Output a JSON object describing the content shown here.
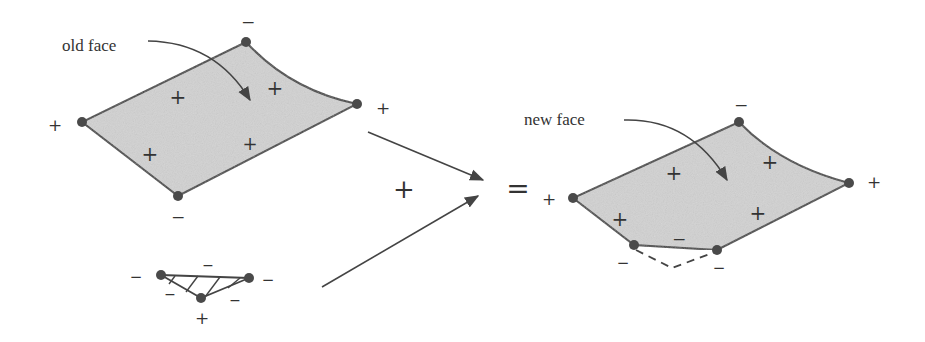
{
  "diagram": {
    "colors": {
      "face_fill": "#d2d2d2",
      "stroke": "#444444",
      "vertex": "#4a4a4a",
      "text": "#333333"
    },
    "old_face": {
      "caption": "old face",
      "vertex_signs": {
        "left": "+",
        "top": "−",
        "right": "+",
        "bottom": "−"
      },
      "interior_signs": [
        "+",
        "+",
        "+",
        "+"
      ]
    },
    "triangle": {
      "vertex_signs": {
        "left": "−",
        "right": "−",
        "bottom": "+"
      },
      "edge_signs": [
        "−",
        "−",
        "−"
      ]
    },
    "operators": {
      "plus": "+",
      "equals": "="
    },
    "new_face": {
      "caption": "new face",
      "vertex_signs": {
        "left": "+",
        "top": "−",
        "right": "+",
        "bottom_left": "−",
        "bottom_right": "−"
      },
      "interior_signs": [
        "+",
        "+",
        "+",
        "+",
        "−"
      ]
    }
  }
}
